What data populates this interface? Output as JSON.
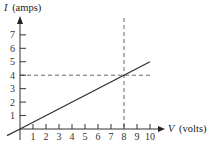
{
  "chart_data": {
    "type": "line",
    "title": "",
    "xlabel": "V (volts)",
    "ylabel": "I (amps)",
    "xlabel_var": "V",
    "xlabel_unit": "(volts)",
    "ylabel_var": "I",
    "ylabel_unit": "(amps)",
    "xlim": [
      0,
      10
    ],
    "ylim": [
      0,
      7
    ],
    "x_ticks": [
      "1",
      "2",
      "3",
      "4",
      "5",
      "6",
      "7",
      "8",
      "9",
      "10"
    ],
    "y_ticks": [
      "1",
      "2",
      "3",
      "4",
      "5",
      "6",
      "7"
    ],
    "grid": false,
    "series": [
      {
        "name": "I vs V",
        "x": [
          -1,
          0,
          10
        ],
        "y": [
          -0.5,
          0,
          5
        ]
      }
    ],
    "annotations": [
      {
        "type": "dashed-vertical",
        "x": 8,
        "label": "V = 8"
      },
      {
        "type": "dashed-horizontal",
        "y": 4,
        "label": "I = 4"
      }
    ]
  }
}
